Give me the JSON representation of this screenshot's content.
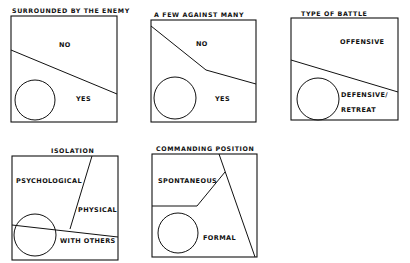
{
  "panels": [
    {
      "title": "SURROUNDED BY THE ENEMY",
      "labels": [
        "NO",
        "YES"
      ]
    },
    {
      "title": "A FEW AGAINST MANY",
      "labels": [
        "NO",
        "YES"
      ]
    },
    {
      "title": "TYPE OF BATTLE",
      "labels": [
        "OFFENSIVE",
        "DEFENSIVE/",
        "RETREAT"
      ]
    },
    {
      "title": "ISOLATION",
      "labels": [
        "PSYCHOLOGICAL",
        "PHYSICAL",
        "WITH OTHERS"
      ]
    },
    {
      "title": "COMMANDING POSITION",
      "labels": [
        "SPONTANEOUS",
        "FORMAL"
      ]
    }
  ],
  "colors": {
    "ink": "#111111",
    "background": "#ffffff"
  }
}
